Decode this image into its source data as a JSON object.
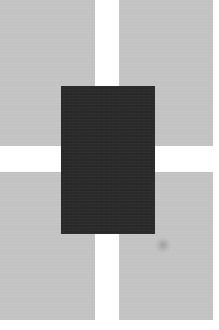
{
  "composition": {
    "description": "Abstract grid: four light gray rectangles in a 2x2 arrangement with a dark rectangle overlapping the center",
    "background_color": "#ffffff",
    "panel_color": "#c4c4c4",
    "center_color": "#2a2a2a",
    "panels": [
      {
        "id": "top-left",
        "x": 0,
        "y": 0,
        "w": 95,
        "h": 146
      },
      {
        "id": "top-right",
        "x": 119,
        "y": 0,
        "w": 94,
        "h": 146
      },
      {
        "id": "bottom-left",
        "x": 0,
        "y": 172,
        "w": 95,
        "h": 148
      },
      {
        "id": "bottom-right",
        "x": 119,
        "y": 172,
        "w": 94,
        "h": 148
      }
    ],
    "center_block": {
      "x": 61,
      "y": 86,
      "w": 94,
      "h": 148
    },
    "smudge": {
      "x": 155,
      "y": 237,
      "w": 16,
      "h": 16
    }
  }
}
